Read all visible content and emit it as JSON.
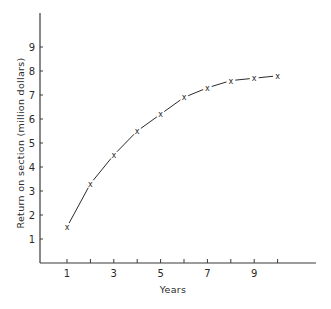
{
  "chart_data": {
    "type": "line",
    "title": "",
    "xlabel": "Years",
    "ylabel": "Return on section (million dollars)",
    "x_tick_labels": [
      "1",
      "3",
      "5",
      "7",
      "9"
    ],
    "x_ticks": [
      1,
      2,
      3,
      4,
      5,
      6,
      7,
      8,
      9,
      10
    ],
    "y_tick_labels": [
      "1",
      "2",
      "3",
      "4",
      "5",
      "6",
      "7",
      "8",
      "9"
    ],
    "y_ticks": [
      1,
      2,
      3,
      4,
      5,
      6,
      7,
      8,
      9
    ],
    "xlim": [
      0,
      11.5
    ],
    "ylim": [
      0,
      10
    ],
    "grid": false,
    "legend": null,
    "marker": "x",
    "series": [
      {
        "name": "Return on section",
        "x": [
          1,
          2,
          3,
          4,
          5,
          6,
          7,
          8,
          9,
          10
        ],
        "values": [
          1.5,
          3.3,
          4.5,
          5.5,
          6.2,
          6.9,
          7.3,
          7.6,
          7.7,
          7.8
        ]
      }
    ]
  }
}
